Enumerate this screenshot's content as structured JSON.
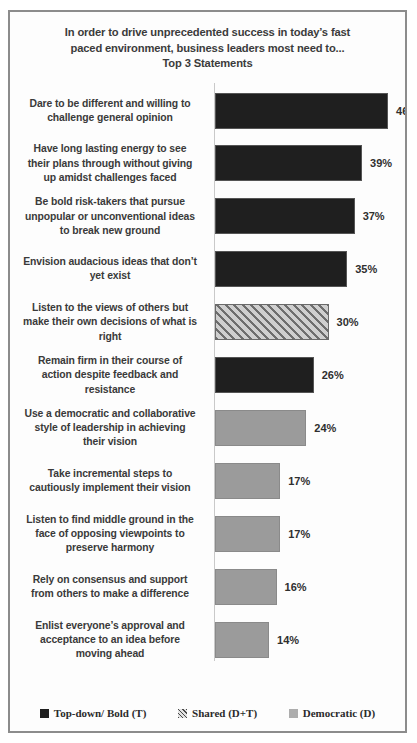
{
  "chart_data": {
    "type": "bar",
    "title": "In order to drive unprecedented success in today’s fast paced environment, business leaders most need to...\nTop 3 Statements",
    "title_lines": [
      "In order to drive unprecedented success in today’s fast",
      "paced environment, business leaders most need to...",
      "Top 3 Statements"
    ],
    "orientation": "horizontal",
    "xlabel": "",
    "ylabel": "",
    "xlim": [
      0,
      50
    ],
    "grid": false,
    "legend_position": "bottom",
    "categories": [
      "Dare to be different and willing to challenge  general opinion",
      "Have long lasting energy to see their plans through without giving up amidst challenges faced",
      "Be bold risk-takers  that pursue unpopular or unconventional ideas to break new ground",
      "Envision audacious ideas that don’t yet exist",
      "Listen to the views of others but make their own decisions of what is right",
      "Remain firm in their course of action despite feedback and resistance",
      "Use a democratic and collaborative style of leadership  in achieving their vision",
      "Take incremental steps to cautiously implement their vision",
      "Listen to find middle ground in the face of opposing viewpoints  to preserve harmony",
      "Rely on consensus and support from others to make a difference",
      "Enlist everyone’s approval and acceptance to an idea before moving ahead"
    ],
    "values": [
      46,
      39,
      37,
      35,
      30,
      26,
      24,
      17,
      17,
      16,
      14
    ],
    "value_labels": [
      "46%",
      "39%",
      "37%",
      "35%",
      "30%",
      "26%",
      "24%",
      "17%",
      "17%",
      "16%",
      "14%"
    ],
    "series_group": [
      "topdown",
      "topdown",
      "topdown",
      "topdown",
      "shared",
      "topdown",
      "democratic",
      "democratic",
      "democratic",
      "democratic",
      "democratic"
    ],
    "bars": [
      {
        "label_lines": [
          "Dare to be different and willing to",
          "challenge  general opinion"
        ],
        "value": 46,
        "value_label": "46%",
        "group": "topdown"
      },
      {
        "label_lines": [
          "Have long lasting energy to see",
          "their plans through without giving",
          "up amidst challenges faced"
        ],
        "value": 39,
        "value_label": "39%",
        "group": "topdown"
      },
      {
        "label_lines": [
          "Be bold risk-takers  that pursue",
          "unpopular or unconventional ideas",
          "to break new ground"
        ],
        "value": 37,
        "value_label": "37%",
        "group": "topdown"
      },
      {
        "label_lines": [
          "Envision audacious ideas that don’t",
          "yet exist"
        ],
        "value": 35,
        "value_label": "35%",
        "group": "topdown"
      },
      {
        "label_lines": [
          "Listen to the views of others but",
          "make their own decisions of what is",
          "right"
        ],
        "value": 30,
        "value_label": "30%",
        "group": "shared"
      },
      {
        "label_lines": [
          "Remain firm in their course of",
          "action despite feedback and",
          "resistance"
        ],
        "value": 26,
        "value_label": "26%",
        "group": "topdown"
      },
      {
        "label_lines": [
          "Use a democratic and collaborative",
          "style of leadership  in achieving",
          "their vision"
        ],
        "value": 24,
        "value_label": "24%",
        "group": "democratic"
      },
      {
        "label_lines": [
          "Take incremental steps to",
          "cautiously implement their vision"
        ],
        "value": 17,
        "value_label": "17%",
        "group": "democratic"
      },
      {
        "label_lines": [
          "Listen to find middle ground in the",
          "face of opposing viewpoints  to",
          "preserve harmony"
        ],
        "value": 17,
        "value_label": "17%",
        "group": "democratic"
      },
      {
        "label_lines": [
          "Rely on consensus and support",
          "from others to make a difference"
        ],
        "value": 16,
        "value_label": "16%",
        "group": "democratic"
      },
      {
        "label_lines": [
          "Enlist everyone’s approval and",
          "acceptance to an idea before",
          "moving ahead"
        ],
        "value": 14,
        "value_label": "14%",
        "group": "democratic"
      }
    ],
    "legend": [
      {
        "key": "topdown",
        "label": "Top-down/ Bold (T)",
        "color": "#1f1f1f"
      },
      {
        "key": "shared",
        "label": "Shared (D+T)",
        "color": "#b0b0b0"
      },
      {
        "key": "democratic",
        "label": "Democratic (D)",
        "color": "#adadad"
      }
    ],
    "colors": {
      "topdown": "#1f1f1f",
      "shared": "#a5a5a5",
      "democratic": "#9b9b9b",
      "border": "#8c8c8c",
      "text": "#3a3a3a",
      "background": "#fdfdfd"
    },
    "px_per_percent": 3.72
  }
}
